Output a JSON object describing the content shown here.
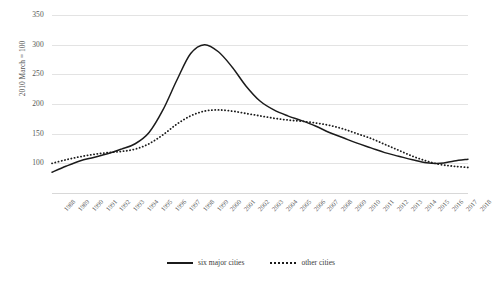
{
  "chart_data": {
    "type": "line",
    "title": "",
    "xlabel": "",
    "ylabel": "2010 March = 100",
    "ylim": [
      50,
      350
    ],
    "yticks": [
      350,
      300,
      250,
      200,
      150,
      100
    ],
    "grid": true,
    "legend_position": "bottom-center",
    "x": [
      1988,
      1989,
      1990,
      1991,
      1992,
      1993,
      1994,
      1995,
      1996,
      1997,
      1998,
      1999,
      2000,
      2001,
      2002,
      2003,
      2004,
      2005,
      2006,
      2007,
      2008,
      2009,
      2010,
      2011,
      2012,
      2013,
      2014,
      2015,
      2016,
      2017,
      2018
    ],
    "xtick_labels": [
      "1988",
      "1989",
      "1990",
      "1991",
      "1992",
      "1993",
      "1994",
      "1995",
      "1996",
      "1997",
      "1998",
      "1999",
      "2000",
      "2001",
      "2002",
      "2003",
      "2004",
      "2005",
      "2006",
      "2007",
      "2008",
      "2009",
      "2010",
      "2011",
      "2012",
      "2013",
      "2014",
      "2015",
      "2016",
      "2017",
      "2018"
    ],
    "series": [
      {
        "name": "six major cities",
        "style": "solid",
        "color": "#1b1b1b",
        "values": [
          85,
          95,
          104,
          110,
          116,
          124,
          133,
          152,
          190,
          240,
          285,
          300,
          288,
          262,
          230,
          205,
          190,
          180,
          172,
          163,
          152,
          143,
          134,
          126,
          118,
          112,
          106,
          101,
          100,
          104,
          107
        ]
      },
      {
        "name": "other cities",
        "style": "dotted",
        "color": "#1b1b1b",
        "values": [
          100,
          106,
          111,
          115,
          118,
          120,
          124,
          133,
          148,
          166,
          180,
          188,
          190,
          188,
          184,
          180,
          176,
          173,
          171,
          168,
          164,
          158,
          150,
          142,
          132,
          122,
          112,
          104,
          98,
          95,
          93
        ]
      }
    ]
  },
  "legend": {
    "entries": [
      {
        "label": "six major cities"
      },
      {
        "label": "other cities"
      }
    ]
  }
}
